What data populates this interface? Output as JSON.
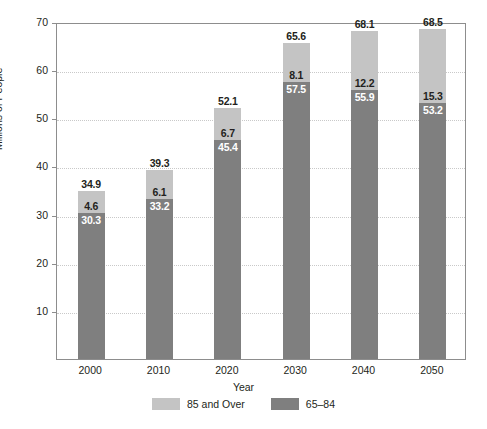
{
  "chart_data": {
    "type": "bar",
    "subtype": "stacked-vertical",
    "title": "",
    "xlabel": "Year",
    "ylabel": "Millions of People",
    "categories": [
      "2000",
      "2010",
      "2020",
      "2030",
      "2040",
      "2050"
    ],
    "ylim": [
      0,
      70
    ],
    "yticks": [
      10,
      20,
      30,
      40,
      50,
      60,
      70
    ],
    "ytick_labels": [
      "10",
      "20",
      "30",
      "40",
      "50",
      "60",
      "70"
    ],
    "grid": true,
    "grid_style": "dotted-horizontal",
    "legend_position": "bottom-center",
    "stack_order": [
      "65-84",
      "85 and Over"
    ],
    "series": [
      {
        "name": "65–84",
        "color": "#7f7f7f",
        "label_color": "#ffffff",
        "values": [
          30.3,
          33.2,
          45.4,
          57.5,
          55.9,
          53.2
        ],
        "value_labels": [
          "30.3",
          "33.2",
          "45.4",
          "57.5",
          "55.9",
          "53.2"
        ]
      },
      {
        "name": "85 and Over",
        "color": "#c4c4c4",
        "label_color": "#231f20",
        "values": [
          4.6,
          6.1,
          6.7,
          8.1,
          12.2,
          15.3
        ],
        "value_labels": [
          "4.6",
          "6.1",
          "6.7",
          "8.1",
          "12.2",
          "15.3"
        ]
      }
    ],
    "totals": [
      34.9,
      39.3,
      52.1,
      65.6,
      68.1,
      68.5
    ],
    "total_labels": [
      "34.9",
      "39.3",
      "52.1",
      "65.6",
      "68.1",
      "68.5"
    ],
    "annotations": []
  },
  "legend": {
    "entries": [
      {
        "label": "85 and Over",
        "color": "#c4c4c4"
      },
      {
        "label": "65–84",
        "color": "#7f7f7f"
      }
    ]
  },
  "colors": {
    "series_85_over": "#c4c4c4",
    "series_65_84": "#7f7f7f",
    "axis": "#8d8d8d",
    "grid": "#c9c9c9",
    "text": "#231f20",
    "background": "#ffffff"
  }
}
